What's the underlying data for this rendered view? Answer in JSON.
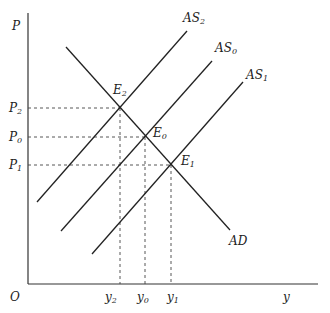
{
  "diagram": {
    "type": "AD-AS model",
    "axes": {
      "y_label": "P",
      "x_label": "y",
      "origin_label": "O"
    },
    "price_levels": [
      {
        "label": "P",
        "sub": "2"
      },
      {
        "label": "P",
        "sub": "0"
      },
      {
        "label": "P",
        "sub": "1"
      }
    ],
    "outputs": [
      {
        "label": "y",
        "sub": "2"
      },
      {
        "label": "y",
        "sub": "0"
      },
      {
        "label": "y",
        "sub": "1"
      }
    ],
    "curves": [
      {
        "label": "AS",
        "sub": "2"
      },
      {
        "label": "AS",
        "sub": "0"
      },
      {
        "label": "AS",
        "sub": "1"
      },
      {
        "label": "AD",
        "sub": ""
      }
    ],
    "equilibria": [
      {
        "label": "E",
        "sub": "2"
      },
      {
        "label": "E",
        "sub": "0"
      },
      {
        "label": "E",
        "sub": "1"
      }
    ],
    "colors": {
      "line": "#222222",
      "dash": "#444444"
    }
  }
}
